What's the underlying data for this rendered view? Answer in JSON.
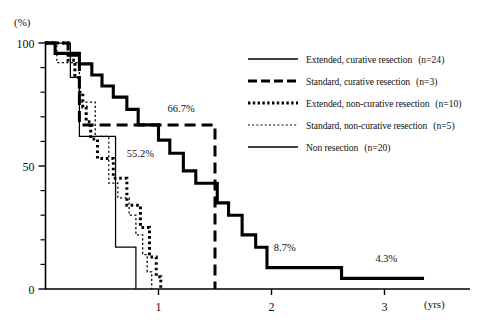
{
  "chart_data": {
    "type": "line",
    "title": "",
    "subtitle": "",
    "xlabel": "(yrs)",
    "ylabel": "(%)",
    "xlim": [
      0,
      3.85
    ],
    "ylim": [
      0,
      100
    ],
    "xticks": [
      1,
      2,
      3
    ],
    "xtick_labels": [
      "1",
      "2",
      "3"
    ],
    "yticks": [
      0,
      10,
      20,
      30,
      40,
      50,
      60,
      70,
      80,
      90,
      100
    ],
    "ytick_labels_shown": [
      "0",
      "50",
      "100"
    ],
    "grid": false,
    "legend_position": "right-top",
    "curve_type": "kaplan-meier-step",
    "annotations": [
      {
        "text": "66.7%",
        "x": 1.08,
        "y": 72.0
      },
      {
        "text": "55.2%",
        "x": 0.72,
        "y": 53.5
      },
      {
        "text": "8.7%",
        "x": 2.02,
        "y": 15.5
      },
      {
        "text": "4.3%",
        "x": 2.92,
        "y": 11.0
      }
    ],
    "series": [
      {
        "name": "Extended, curative resection",
        "n": 24,
        "style": "thick-solid",
        "points": [
          [
            0.0,
            100
          ],
          [
            0.085,
            100
          ],
          [
            0.085,
            95.8
          ],
          [
            0.3,
            95.8
          ],
          [
            0.3,
            91.5
          ],
          [
            0.41,
            91.5
          ],
          [
            0.41,
            87.0
          ],
          [
            0.5,
            87.0
          ],
          [
            0.5,
            82.5
          ],
          [
            0.6,
            82.5
          ],
          [
            0.6,
            78.0
          ],
          [
            0.72,
            78.0
          ],
          [
            0.72,
            73.0
          ],
          [
            0.82,
            73.0
          ],
          [
            0.82,
            66.7
          ],
          [
            1.0,
            66.7
          ],
          [
            1.0,
            60.5
          ],
          [
            1.1,
            60.5
          ],
          [
            1.1,
            55.2
          ],
          [
            1.22,
            55.2
          ],
          [
            1.22,
            48.0
          ],
          [
            1.33,
            48.0
          ],
          [
            1.33,
            43.0
          ],
          [
            1.52,
            43.0
          ],
          [
            1.52,
            35.0
          ],
          [
            1.62,
            35.0
          ],
          [
            1.62,
            30.0
          ],
          [
            1.74,
            30.0
          ],
          [
            1.74,
            22.0
          ],
          [
            1.86,
            22.0
          ],
          [
            1.86,
            17.0
          ],
          [
            1.96,
            17.0
          ],
          [
            1.96,
            8.7
          ],
          [
            2.62,
            8.7
          ],
          [
            2.62,
            4.3
          ],
          [
            3.35,
            4.3
          ]
        ]
      },
      {
        "name": "Standard, curative resection",
        "n": 3,
        "style": "thick-dashed",
        "points": [
          [
            0.0,
            100
          ],
          [
            0.2,
            100
          ],
          [
            0.2,
            95.0
          ],
          [
            0.3,
            95.0
          ],
          [
            0.3,
            66.7
          ],
          [
            1.5,
            66.7
          ],
          [
            1.5,
            0
          ]
        ]
      },
      {
        "name": "Extended, non-curative resection",
        "n": 10,
        "style": "thick-dotted",
        "points": [
          [
            0.0,
            100
          ],
          [
            0.2,
            100
          ],
          [
            0.2,
            93.0
          ],
          [
            0.26,
            93.0
          ],
          [
            0.26,
            86.0
          ],
          [
            0.3,
            86.0
          ],
          [
            0.3,
            80.0
          ],
          [
            0.33,
            80.0
          ],
          [
            0.33,
            74.0
          ],
          [
            0.36,
            74.0
          ],
          [
            0.36,
            68.0
          ],
          [
            0.4,
            68.0
          ],
          [
            0.4,
            61.0
          ],
          [
            0.46,
            61.0
          ],
          [
            0.46,
            53.0
          ],
          [
            0.6,
            53.0
          ],
          [
            0.6,
            45.0
          ],
          [
            0.72,
            45.0
          ],
          [
            0.72,
            34.0
          ],
          [
            0.84,
            34.0
          ],
          [
            0.84,
            25.0
          ],
          [
            0.92,
            25.0
          ],
          [
            0.92,
            13.0
          ],
          [
            0.98,
            13.0
          ],
          [
            0.98,
            5.0
          ],
          [
            1.02,
            5.0
          ],
          [
            1.02,
            0
          ]
        ]
      },
      {
        "name": "Standard, non-curative resection",
        "n": 5,
        "style": "thin-dotted",
        "points": [
          [
            0.0,
            100
          ],
          [
            0.1,
            100
          ],
          [
            0.1,
            92.0
          ],
          [
            0.3,
            92.0
          ],
          [
            0.3,
            76.0
          ],
          [
            0.44,
            76.0
          ],
          [
            0.44,
            62.0
          ],
          [
            0.56,
            62.0
          ],
          [
            0.56,
            43.0
          ],
          [
            0.64,
            43.0
          ],
          [
            0.64,
            37.0
          ],
          [
            0.74,
            37.0
          ],
          [
            0.74,
            30.0
          ],
          [
            0.8,
            30.0
          ],
          [
            0.8,
            22.0
          ],
          [
            0.86,
            22.0
          ],
          [
            0.86,
            14.0
          ],
          [
            0.9,
            14.0
          ],
          [
            0.9,
            7.0
          ],
          [
            0.94,
            7.0
          ],
          [
            0.94,
            0
          ]
        ]
      },
      {
        "name": "Non resection",
        "n": 20,
        "style": "thin-solid",
        "points": [
          [
            0.0,
            100
          ],
          [
            0.22,
            100
          ],
          [
            0.22,
            86.0
          ],
          [
            0.3,
            86.0
          ],
          [
            0.3,
            62.0
          ],
          [
            0.62,
            62.0
          ],
          [
            0.62,
            17.0
          ],
          [
            0.8,
            17.0
          ],
          [
            0.8,
            0
          ]
        ]
      }
    ]
  },
  "axes": {
    "y_unit_label": "(%)",
    "x_unit_label": "(yrs)",
    "y_labels": [
      {
        "value": 100,
        "text": "100"
      },
      {
        "value": 50,
        "text": "50"
      },
      {
        "value": 0,
        "text": "0"
      }
    ],
    "x_labels": [
      {
        "value": 1,
        "text": "1"
      },
      {
        "value": 2,
        "text": "2"
      },
      {
        "value": 3,
        "text": "3"
      }
    ]
  },
  "legend": {
    "items": [
      {
        "label": "Extended, curative resection",
        "n_text": "(n=24)",
        "style": "thick-solid"
      },
      {
        "label": "Standard, curative resection",
        "n_text": "(n=3)",
        "style": "thick-dashed"
      },
      {
        "label": "Extended,  non-curative resection",
        "n_text": "(n=10)",
        "style": "thick-dotted"
      },
      {
        "label": "Standard, non-curative resection",
        "n_text": "(n=5)",
        "style": "thin-dotted"
      },
      {
        "label": "Non resection",
        "n_text": "(n=20)",
        "style": "thin-solid"
      }
    ]
  },
  "colors": {
    "ink": "#000000",
    "background": "#ffffff"
  }
}
